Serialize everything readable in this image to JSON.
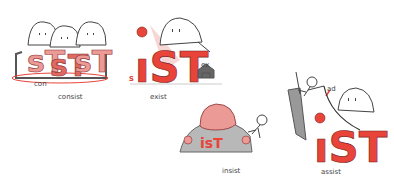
{
  "colors": {
    "red": "#e8443a",
    "pink_red": "#ec9a96",
    "light_pink": "#f4c6c3",
    "gray": "#8a8a8a",
    "light_gray": "#c8c8c8",
    "outline": "#444444",
    "head": "#ffffff"
  },
  "panels": [
    {
      "id": "consist",
      "word": "consist",
      "prefix": "con",
      "root_glyph": "sT"
    },
    {
      "id": "exist",
      "word": "exist",
      "prefix": "ex",
      "root_glyph": "isT",
      "small_s": "s"
    },
    {
      "id": "insist",
      "word": "insist",
      "root_glyph": "isT"
    },
    {
      "id": "assist",
      "word": "assist",
      "prefix": "ad",
      "root_glyph": "isT"
    }
  ]
}
